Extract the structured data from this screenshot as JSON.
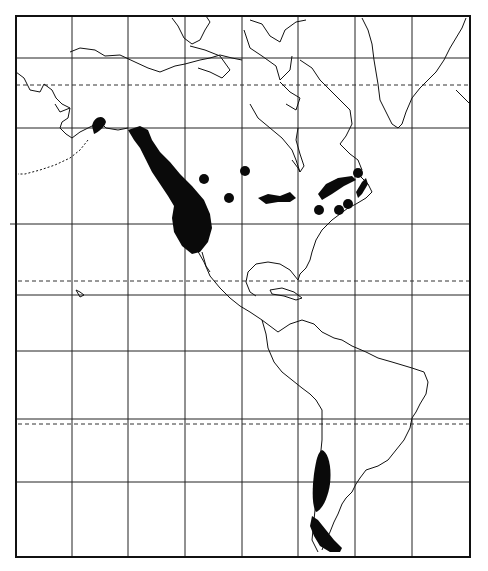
{
  "map": {
    "type": "distribution-map",
    "region": "North and South America",
    "style": "black-and-white line map",
    "colors": {
      "background": "#ffffff",
      "ink": "#111111",
      "range_fill": "#0a0a0a"
    },
    "frame": {
      "left": 16,
      "top": 16,
      "right": 470,
      "bottom": 557
    },
    "grid": {
      "meridians_x": [
        72,
        128,
        185,
        242,
        298,
        355,
        412
      ],
      "parallels_y": [
        58,
        128,
        224,
        295,
        351,
        419,
        482
      ],
      "dashed_parallels_y": [
        85,
        281,
        424
      ]
    },
    "range_areas": [
      {
        "name": "alaska-peninsula-patch"
      },
      {
        "name": "pacific-coast-range"
      },
      {
        "name": "great-lakes-range"
      },
      {
        "name": "st-lawrence-range"
      },
      {
        "name": "newfoundland-range"
      },
      {
        "name": "southern-andes-range"
      },
      {
        "name": "tierra-del-fuego-range"
      }
    ],
    "point_records": [
      {
        "name": "point-1",
        "x": 204,
        "y": 179
      },
      {
        "name": "point-2",
        "x": 245,
        "y": 171
      },
      {
        "name": "point-3",
        "x": 229,
        "y": 198
      },
      {
        "name": "point-4",
        "x": 358,
        "y": 173
      },
      {
        "name": "point-5",
        "x": 319,
        "y": 210
      },
      {
        "name": "point-6",
        "x": 339,
        "y": 210
      },
      {
        "name": "point-7",
        "x": 348,
        "y": 204
      }
    ]
  }
}
